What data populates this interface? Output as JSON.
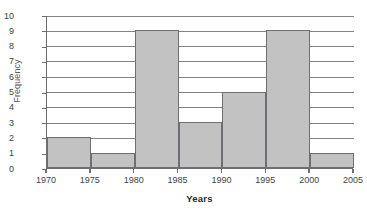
{
  "chart_data": {
    "type": "bar",
    "title": "",
    "subtitle": "",
    "xlabel": "Years",
    "ylabel": "Frequency",
    "categories": [
      "1970-1975",
      "1975-1980",
      "1980-1985",
      "1985-1990",
      "1990-1995",
      "1995-2000",
      "2000-2005"
    ],
    "bin_edges": [
      1970,
      1975,
      1980,
      1985,
      1990,
      1995,
      2000,
      2005
    ],
    "values": [
      2,
      1,
      9,
      3,
      5,
      9,
      1
    ],
    "xlim": [
      1970,
      2005
    ],
    "ylim": [
      0,
      10
    ],
    "x_tick_labels": [
      "1970",
      "1975",
      "1980",
      "1985",
      "1990",
      "1995",
      "2000",
      "2005"
    ],
    "y_tick_labels": [
      "0",
      "1",
      "2",
      "3",
      "4",
      "5",
      "6",
      "7",
      "8",
      "9",
      "10"
    ],
    "y_tick_step": 1,
    "grid": "horizontal",
    "legend": "none",
    "bar_fill_color": "#c2c2c2",
    "bar_border_color": "#6d6e71",
    "gridline_color": "#808285",
    "axis_color": "#6d6e71",
    "background_color": "#ffffff"
  }
}
